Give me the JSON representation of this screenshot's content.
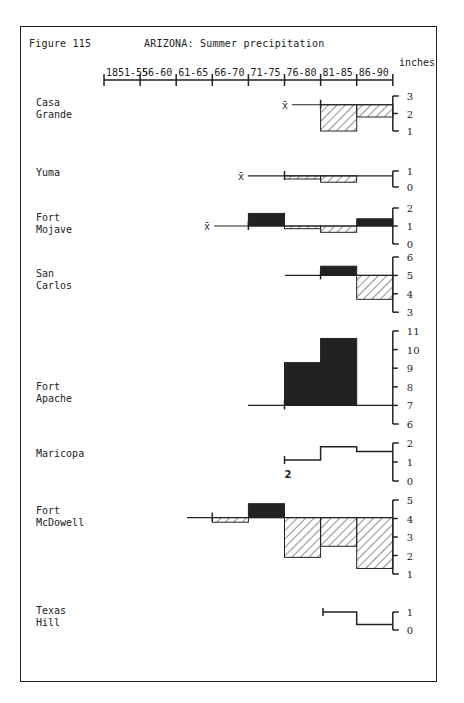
{
  "figure": {
    "label": "Figure 115",
    "title": "ARIZONA:  Summer precipitation",
    "units": "inches"
  },
  "chart_data": {
    "type": "step-bar",
    "title": "ARIZONA: Summer precipitation",
    "figure_label": "Figure 115",
    "xlabel": "",
    "ylabel": "inches",
    "categories": [
      "1851-55",
      "56-60",
      "61-65",
      "66-70",
      "71-75",
      "76-80",
      "81-85",
      "86-90"
    ],
    "legend": {
      "solid": "above mean",
      "hatched": "below mean",
      "x_bar": "mean (x̄)"
    },
    "stations": [
      {
        "name": "Casa Grande",
        "mean": 2.5,
        "ticks": [
          3,
          2,
          1
        ],
        "ylim": [
          1,
          3
        ],
        "values": {
          "81-85": 1.0,
          "86-90": 1.8
        }
      },
      {
        "name": "Yuma",
        "mean": 0.7,
        "ticks": [
          1,
          0
        ],
        "ylim": [
          0,
          1
        ],
        "values": {
          "76-80": 0.5,
          "81-85": 0.3,
          "86-90": 0.7
        }
      },
      {
        "name": "Fort Mojave",
        "mean": 1.0,
        "ticks": [
          2,
          1,
          0
        ],
        "ylim": [
          0,
          2
        ],
        "values": {
          "71-75": 1.7,
          "76-80": 0.85,
          "81-85": 0.65,
          "86-90": 1.4
        }
      },
      {
        "name": "San Carlos",
        "mean": 5.0,
        "ticks": [
          6,
          5,
          4,
          3
        ],
        "ylim": [
          3,
          6
        ],
        "values": {
          "81-85": 5.5,
          "86-90": 3.7
        }
      },
      {
        "name": "Fort Apache",
        "mean": 7.0,
        "ticks": [
          11,
          10,
          9,
          8,
          7,
          6
        ],
        "ylim": [
          6,
          11
        ],
        "values": {
          "76-80": 9.3,
          "81-85": 10.6,
          "86-90": 7.0
        }
      },
      {
        "name": "Maricopa",
        "mean": null,
        "ticks": [
          2,
          1,
          0
        ],
        "ylim": [
          0,
          2
        ],
        "values": {
          "76-80": 1.1,
          "81-85": 1.8,
          "86-90": 1.55
        },
        "annotation": "2"
      },
      {
        "name": "Fort McDowell",
        "mean": 4.05,
        "ticks": [
          5,
          4,
          3,
          2,
          1
        ],
        "ylim": [
          1,
          5
        ],
        "values": {
          "66-70": 3.8,
          "71-75": 4.8,
          "76-80": 1.9,
          "81-85": 2.5,
          "86-90": 1.3
        }
      },
      {
        "name": "Texas Hill",
        "mean": null,
        "ticks": [
          1,
          0
        ],
        "ylim": [
          0,
          1
        ],
        "values": {
          "81-85": 1.0,
          "86-90": 0.3
        }
      }
    ]
  },
  "stations": [
    {
      "label": "Casa\nGrande"
    },
    {
      "label": "Yuma"
    },
    {
      "label": "Fort\nMojave"
    },
    {
      "label": "San\nCarlos"
    },
    {
      "label": "Fort\nApache"
    },
    {
      "label": "Maricopa"
    },
    {
      "label": "Fort\nMcDowell"
    },
    {
      "label": "Texas\nHill"
    }
  ],
  "annotations": {
    "xbar": "x̄",
    "maricopa_note": "2"
  },
  "colors": {
    "ink": "#222222",
    "paper": "#ffffff"
  }
}
